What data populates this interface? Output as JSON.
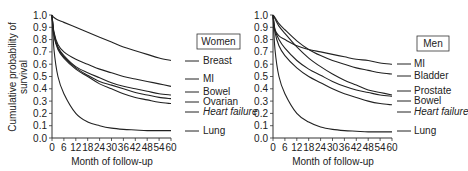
{
  "chart_data": [
    {
      "type": "line",
      "title": "Women",
      "xlabel": "Month of follow-up",
      "ylabel": "Cumulative probability of survival",
      "x_ticks": [
        0,
        6,
        12,
        18,
        24,
        30,
        36,
        42,
        48,
        54,
        60
      ],
      "y_ticks": [
        "0.0",
        "0.1",
        "0.2",
        "0.3",
        "0.4",
        "0.5",
        "0.6",
        "0.7",
        "0.8",
        "0.9",
        "1.0"
      ],
      "xlim": [
        0,
        60
      ],
      "ylim": [
        0,
        1.0
      ],
      "x": [
        0,
        1,
        3,
        6,
        12,
        18,
        24,
        30,
        36,
        42,
        48,
        54,
        60
      ],
      "series": [
        {
          "name": "Breast",
          "italic": false,
          "values": [
            1.0,
            0.98,
            0.96,
            0.94,
            0.9,
            0.86,
            0.82,
            0.78,
            0.74,
            0.71,
            0.68,
            0.65,
            0.63
          ]
        },
        {
          "name": "MI",
          "italic": false,
          "values": [
            1.0,
            0.86,
            0.76,
            0.7,
            0.64,
            0.6,
            0.56,
            0.53,
            0.5,
            0.48,
            0.46,
            0.44,
            0.42
          ]
        },
        {
          "name": "Bowel",
          "italic": false,
          "values": [
            1.0,
            0.85,
            0.74,
            0.67,
            0.58,
            0.53,
            0.49,
            0.45,
            0.42,
            0.4,
            0.38,
            0.36,
            0.35
          ]
        },
        {
          "name": "Ovarian",
          "italic": false,
          "values": [
            1.0,
            0.84,
            0.73,
            0.66,
            0.57,
            0.51,
            0.46,
            0.43,
            0.4,
            0.37,
            0.35,
            0.33,
            0.32
          ]
        },
        {
          "name": "Heart failure",
          "italic": true,
          "values": [
            1.0,
            0.83,
            0.72,
            0.65,
            0.56,
            0.5,
            0.44,
            0.4,
            0.36,
            0.33,
            0.31,
            0.29,
            0.28
          ]
        },
        {
          "name": "Lung",
          "italic": false,
          "values": [
            1.0,
            0.72,
            0.5,
            0.36,
            0.2,
            0.13,
            0.1,
            0.08,
            0.07,
            0.065,
            0.06,
            0.06,
            0.06
          ]
        }
      ],
      "legend_position": "right"
    },
    {
      "type": "line",
      "title": "Men",
      "xlabel": "Month of follow-up",
      "ylabel": "",
      "x_ticks": [
        0,
        6,
        12,
        18,
        24,
        30,
        36,
        42,
        48,
        54,
        60
      ],
      "y_ticks": [
        "0.0",
        "0.1",
        "0.2",
        "0.3",
        "0.4",
        "0.5",
        "0.6",
        "0.7",
        "0.8",
        "0.9",
        "1.0"
      ],
      "xlim": [
        0,
        60
      ],
      "ylim": [
        0,
        1.0
      ],
      "x": [
        0,
        1,
        3,
        6,
        12,
        18,
        24,
        30,
        36,
        42,
        48,
        54,
        60
      ],
      "series": [
        {
          "name": "MI",
          "italic": false,
          "values": [
            1.0,
            0.88,
            0.83,
            0.8,
            0.75,
            0.72,
            0.7,
            0.68,
            0.66,
            0.64,
            0.63,
            0.61,
            0.6
          ]
        },
        {
          "name": "Bladder",
          "italic": false,
          "values": [
            1.0,
            0.98,
            0.93,
            0.88,
            0.79,
            0.72,
            0.67,
            0.63,
            0.6,
            0.57,
            0.55,
            0.53,
            0.52
          ]
        },
        {
          "name": "Prostate",
          "italic": false,
          "values": [
            1.0,
            0.97,
            0.91,
            0.85,
            0.74,
            0.65,
            0.58,
            0.52,
            0.47,
            0.43,
            0.39,
            0.37,
            0.35
          ]
        },
        {
          "name": "Bowel",
          "italic": false,
          "values": [
            1.0,
            0.88,
            0.8,
            0.73,
            0.63,
            0.56,
            0.51,
            0.46,
            0.42,
            0.39,
            0.37,
            0.35,
            0.34
          ]
        },
        {
          "name": "Heart failure",
          "italic": true,
          "values": [
            1.0,
            0.86,
            0.75,
            0.67,
            0.57,
            0.5,
            0.45,
            0.4,
            0.36,
            0.33,
            0.3,
            0.28,
            0.27
          ]
        },
        {
          "name": "Lung",
          "italic": false,
          "values": [
            1.0,
            0.72,
            0.5,
            0.36,
            0.2,
            0.13,
            0.09,
            0.07,
            0.06,
            0.055,
            0.05,
            0.05,
            0.05
          ]
        }
      ],
      "legend_position": "right"
    }
  ],
  "panels": [
    {
      "title": "Women",
      "xlabel": "Month of follow-up",
      "ylabel_line1": "Cumulative probability of",
      "ylabel_line2": "survival"
    },
    {
      "title": "Men",
      "xlabel": "Month of follow-up"
    }
  ]
}
